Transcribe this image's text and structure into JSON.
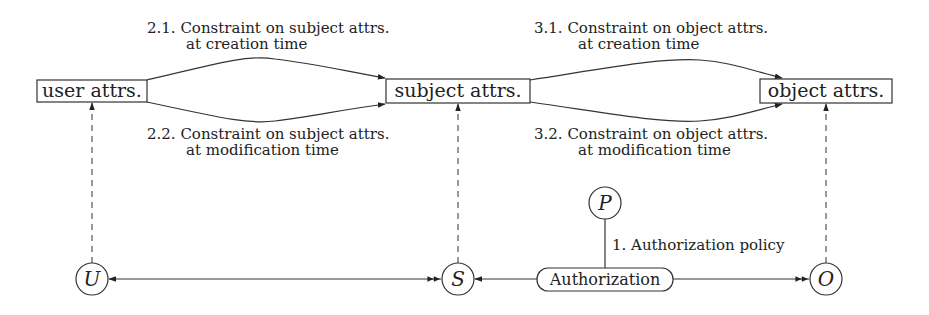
{
  "diagram": {
    "boxes": {
      "user": "user attrs.",
      "subject": "subject attrs.",
      "object": "object attrs."
    },
    "nodes": {
      "user": "U",
      "subject": "S",
      "object": "O",
      "policy": "P"
    },
    "authorization": "Authorization",
    "labels": {
      "c21_line1": "2.1. Constraint on subject attrs.",
      "c21_line2": "at creation time",
      "c22_line1": "2.2. Constraint on subject attrs.",
      "c22_line2": "at modification time",
      "c31_line1": "3.1. Constraint on object attrs.",
      "c31_line2": "at creation time",
      "c32_line1": "3.2. Constraint on object attrs.",
      "c32_line2": "at modification time",
      "policy": "1. Authorization policy"
    }
  }
}
